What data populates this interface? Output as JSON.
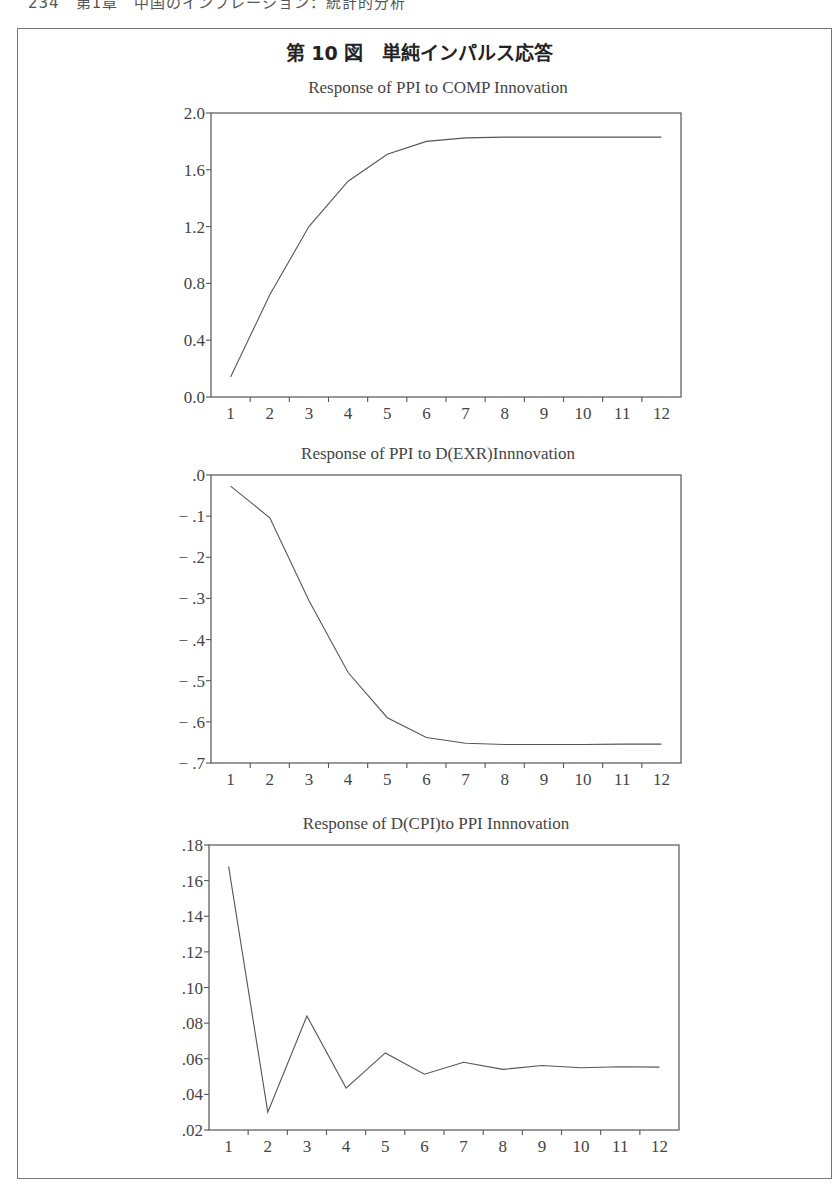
{
  "page": {
    "header": "234　第1章　中国のインフレーション：統計的分析",
    "figure_title": "第 10 図　単純インパルス応答"
  },
  "chart_data": [
    {
      "type": "line",
      "title": "Response of PPI to COMP Innovation",
      "xlabel": "",
      "ylabel": "",
      "categories": [
        "1",
        "2",
        "3",
        "4",
        "5",
        "6",
        "7",
        "8",
        "9",
        "10",
        "11",
        "12"
      ],
      "x": [
        1,
        2,
        3,
        4,
        5,
        6,
        7,
        8,
        9,
        10,
        11,
        12
      ],
      "values": [
        0.14,
        0.72,
        1.2,
        1.52,
        1.71,
        1.8,
        1.825,
        1.83,
        1.83,
        1.83,
        1.83,
        1.83
      ],
      "ylim": [
        0.0,
        2.0
      ],
      "yticks": [
        0.0,
        0.4,
        0.8,
        1.2,
        1.6,
        2.0
      ],
      "ytick_labels": [
        "0.0",
        "0.4",
        "0.8",
        "1.2",
        "1.6",
        "2.0"
      ],
      "grid": false,
      "legend": null,
      "box": {
        "left": 211,
        "top": 113,
        "right": 681,
        "bottom": 397
      },
      "title_y": 93
    },
    {
      "type": "line",
      "title": "Response of PPI to D(EXR)Innnovation",
      "xlabel": "",
      "ylabel": "",
      "categories": [
        "1",
        "2",
        "3",
        "4",
        "5",
        "6",
        "7",
        "8",
        "9",
        "10",
        "11",
        "12"
      ],
      "x": [
        1,
        2,
        3,
        4,
        5,
        6,
        7,
        8,
        9,
        10,
        11,
        12
      ],
      "values": [
        -0.027,
        -0.104,
        -0.305,
        -0.48,
        -0.59,
        -0.638,
        -0.652,
        -0.655,
        -0.655,
        -0.655,
        -0.654,
        -0.654
      ],
      "ylim": [
        -0.7,
        0.0
      ],
      "yticks": [
        0.0,
        -0.1,
        -0.2,
        -0.3,
        -0.4,
        -0.5,
        -0.6,
        -0.7
      ],
      "ytick_labels": [
        ".0",
        "− .1",
        "− .2",
        "− .3",
        "− .4",
        "− .5",
        "− .6",
        "− .7"
      ],
      "grid": false,
      "legend": null,
      "box": {
        "left": 211,
        "top": 475,
        "right": 681,
        "bottom": 763
      },
      "title_y": 459
    },
    {
      "type": "line",
      "title": "Response of D(CPI)to PPI Innnovation",
      "xlabel": "",
      "ylabel": "",
      "categories": [
        "1",
        "2",
        "3",
        "4",
        "5",
        "6",
        "7",
        "8",
        "9",
        "10",
        "11",
        "12"
      ],
      "x": [
        1,
        2,
        3,
        4,
        5,
        6,
        7,
        8,
        9,
        10,
        11,
        12
      ],
      "values": [
        0.168,
        0.03,
        0.084,
        0.0435,
        0.0633,
        0.0513,
        0.058,
        0.054,
        0.0562,
        0.055,
        0.0555,
        0.0553
      ],
      "ylim": [
        0.02,
        0.18
      ],
      "yticks": [
        0.02,
        0.04,
        0.06,
        0.08,
        0.1,
        0.12,
        0.14,
        0.16,
        0.18
      ],
      "ytick_labels": [
        ".02",
        ".04",
        ".06",
        ".08",
        ".10",
        ".12",
        ".14",
        ".16",
        ".18"
      ],
      "grid": false,
      "legend": null,
      "box": {
        "left": 209,
        "top": 845,
        "right": 679,
        "bottom": 1130
      },
      "title_y": 829
    }
  ]
}
